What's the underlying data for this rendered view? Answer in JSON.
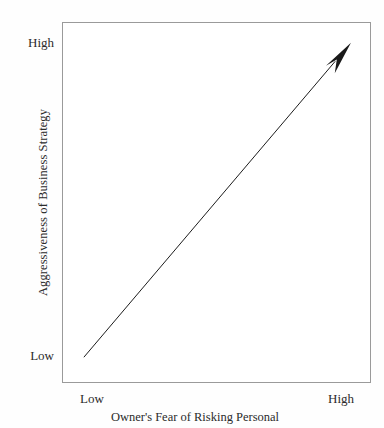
{
  "figure": {
    "background_color": "#fefefe",
    "plot_background_color": "#ffffff",
    "border_color": "#9a9a9a",
    "ink_color": "#2b2b2b"
  },
  "axes": {
    "x": {
      "title": "Owner's Fear of Risking Personal",
      "tick_low": "Low",
      "tick_high": "High"
    },
    "y": {
      "title": "Aggressiveness of Business Strategy",
      "tick_low": "Low",
      "tick_high": "High"
    }
  },
  "chart_data": {
    "type": "line",
    "title": "",
    "subtitle": "",
    "xlabel": "Owner's Fear of Risking Personal",
    "ylabel": "Aggressiveness of Business Strategy",
    "xlim": [
      0,
      1
    ],
    "ylim": [
      0,
      1
    ],
    "xticks": [
      0,
      1
    ],
    "xticklabels": [
      "Low",
      "High"
    ],
    "yticks": [
      0,
      1
    ],
    "yticklabels": [
      "Low",
      "High"
    ],
    "grid": false,
    "legend": null,
    "legend_position": "none",
    "series": [
      {
        "name": "Positive relationship trend",
        "style": "arrow",
        "color": "#1a1a1a",
        "linewidth": 1,
        "arrowhead": "filled-triangle-notched",
        "x": [
          0.068,
          0.938
        ],
        "y": [
          0.069,
          0.945
        ]
      }
    ],
    "annotations": [
      {
        "text": "Upward arrow indicating aggressiveness of business strategy increases as owner's fear of risking personal assets increases",
        "type": "implied-trend"
      }
    ]
  }
}
